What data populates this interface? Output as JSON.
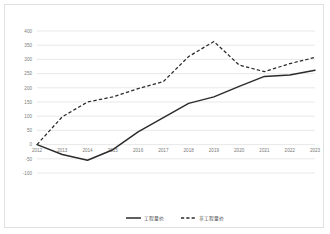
{
  "chart_data": {
    "type": "line",
    "title": "",
    "xlabel": "",
    "ylabel": "",
    "categories": [
      "2012",
      "2013",
      "2014",
      "2015",
      "2016",
      "2017",
      "2018",
      "2019",
      "2020",
      "2021",
      "2022",
      "2023"
    ],
    "ylim": [
      -100,
      400
    ],
    "yticks": [
      400,
      350,
      300,
      250,
      200,
      150,
      100,
      50,
      0,
      -50,
      -100
    ],
    "ytick_labels": [
      "400",
      "350",
      "300",
      "250",
      "200",
      "150",
      "100",
      "50",
      "0",
      "-50",
      "-100"
    ],
    "grid": true,
    "legend_position": "bottom",
    "series": [
      {
        "name": "工程量价",
        "style": "solid",
        "color": "#2b2b2b",
        "values": [
          0,
          -35,
          -55,
          -18,
          45,
          95,
          145,
          168,
          205,
          240,
          245,
          262
        ]
      },
      {
        "name": "非工程量价",
        "style": "dashed",
        "color": "#2b2b2b",
        "values": [
          0,
          98,
          150,
          168,
          197,
          222,
          310,
          363,
          280,
          257,
          285,
          307
        ]
      }
    ]
  },
  "legend": {
    "items": [
      {
        "label": "工程量价",
        "style": "solid"
      },
      {
        "label": "非工程量价",
        "style": "dashed"
      }
    ]
  },
  "colors": {
    "border": "#e2e2e2",
    "grid": "#d9d9d9",
    "tick_text": "#7a7a7a",
    "series": "#2b2b2b",
    "background": "#ffffff"
  }
}
